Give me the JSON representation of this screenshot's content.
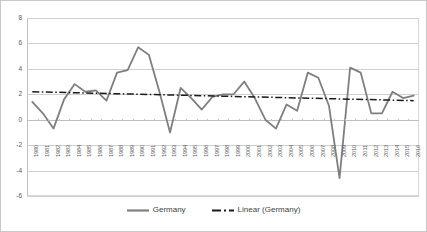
{
  "chart_data": {
    "type": "line",
    "title": "",
    "subtitle": "",
    "xlabel": "",
    "ylabel": "",
    "ylim": [
      -6,
      8
    ],
    "ytick_values": [
      8,
      6,
      4,
      2,
      0,
      -2,
      -4,
      -6
    ],
    "ytick_labels": [
      "8",
      "6",
      "4",
      "2",
      "0",
      "-2",
      "-4",
      "-6"
    ],
    "grid": true,
    "legend_position": "bottom",
    "categories": [
      "1980",
      "1981",
      "1982",
      "1983",
      "1984",
      "1985",
      "1986",
      "1987",
      "1988",
      "1989",
      "1990",
      "1991",
      "1992",
      "1993",
      "1994",
      "1995",
      "1996",
      "1997",
      "1998",
      "1999",
      "2000",
      "2001",
      "2002",
      "2003",
      "2004",
      "2005",
      "2006",
      "2007",
      "2008",
      "2009",
      "2010",
      "2011",
      "2012",
      "2013",
      "2014",
      "2015",
      "2016"
    ],
    "x": [
      1980,
      1981,
      1982,
      1983,
      1984,
      1985,
      1986,
      1987,
      1988,
      1989,
      1990,
      1991,
      1992,
      1993,
      1994,
      1995,
      1996,
      1997,
      1998,
      1999,
      2000,
      2001,
      2002,
      2003,
      2004,
      2005,
      2006,
      2007,
      2008,
      2009,
      2010,
      2011,
      2012,
      2013,
      2014,
      2015,
      2016
    ],
    "series": [
      {
        "name": "Germany",
        "style": "solid",
        "color": "#7F7F7F",
        "width": 1.8,
        "values": [
          1.4,
          0.5,
          -0.7,
          1.6,
          2.8,
          2.2,
          2.3,
          1.5,
          3.7,
          3.9,
          5.7,
          5.1,
          2.2,
          -1.0,
          2.5,
          1.7,
          0.8,
          1.8,
          2.0,
          2.0,
          3.0,
          1.7,
          0.0,
          -0.7,
          1.2,
          0.7,
          3.7,
          3.3,
          1.1,
          -4.6,
          4.1,
          3.7,
          0.5,
          0.5,
          2.2,
          1.7,
          1.9
        ]
      },
      {
        "name": "Linear (Germany)",
        "style": "dash-dot",
        "color": "#1A1A1A",
        "width": 1.5,
        "trendline": true,
        "start_value": 2.2,
        "end_value": 1.5
      }
    ]
  },
  "legend": {
    "entries": [
      {
        "label": "Germany",
        "swatch": "solid-line-swatch"
      },
      {
        "label": "Linear (Germany)",
        "swatch": "dash-dot-line-swatch"
      }
    ]
  },
  "colors": {
    "series_line": "#7F7F7F",
    "trend_line": "#1A1A1A",
    "gridline": "#D0D0D0",
    "axis": "#BFBFBF",
    "tick_label": "#595959",
    "plot_background": "#FFFFFF",
    "frame_border": "#C8C8C8"
  }
}
